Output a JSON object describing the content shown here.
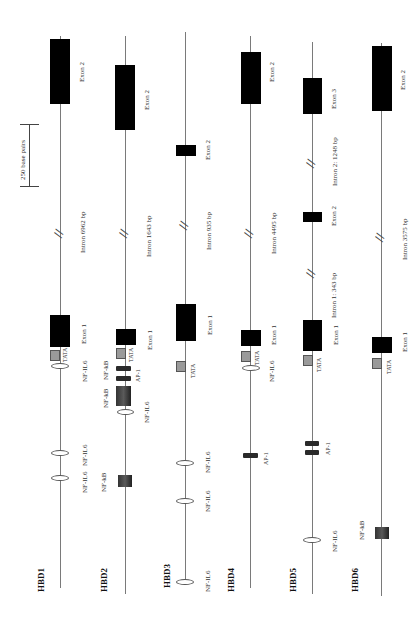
{
  "scale_bar": {
    "label": "250 base pairs"
  },
  "genes": [
    {
      "name": "HBD1",
      "exon1": "Exon 1",
      "exon2": "Exon 2",
      "intron": "Intron 6962 bp",
      "tata": "TATA",
      "elements": [
        "NF-IL6",
        "NF-IL6",
        "NF-IL6"
      ]
    },
    {
      "name": "HBD2",
      "exon1": "Exon 1",
      "exon2": "Exon 2",
      "intron": "Intron 1643 bp",
      "tata": "TATA",
      "elements": [
        "AP-1",
        "NF-kB",
        "NF-kB",
        "NF-IL6",
        "NF-kB"
      ]
    },
    {
      "name": "HBD3",
      "exon1": "Exon 1",
      "exon2": "Exon 2",
      "intron": "Intron 935 bp",
      "tata": "TATA",
      "elements": [
        "NF-IL6",
        "NF-IL6",
        "NF-IL6"
      ]
    },
    {
      "name": "HBD4",
      "exon1": "Exon 1",
      "exon2": "Exon 2",
      "intron": "Intron 4495 bp",
      "tata": "TATA",
      "elements": [
        "NF-IL6",
        "AP-1"
      ]
    },
    {
      "name": "HBD5",
      "exon1": "Exon 1",
      "exon2": "Exon 2",
      "exon3": "Exon 3",
      "intron1": "Intron 1: 343 bp",
      "intron2": "Intron 2: 1248 bp",
      "tata": "TATA",
      "elements": [
        "AP-1",
        "NF-IL6"
      ]
    },
    {
      "name": "HBD6",
      "exon1": "Exon 1",
      "exon2": "Exon 2",
      "intron": "Intron 3575 bp",
      "tata": "TATA",
      "elements": [
        "NF-kB"
      ]
    }
  ],
  "legend_colors": {
    "exon": "#000000",
    "tata": "#9a9a9a",
    "ap1": "#2a2a2a",
    "nfkb": "#444444",
    "nfil6": "#ffffff"
  }
}
